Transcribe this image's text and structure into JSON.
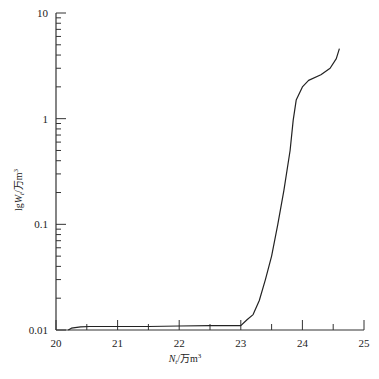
{
  "chart_data": {
    "type": "line",
    "title": "",
    "xlabel": "N_t/万m³",
    "ylabel": "lgW_t/万m³",
    "xlabel_parts": {
      "main": "N",
      "sub": "t",
      "rest": "/万m",
      "sup": "3"
    },
    "ylabel_parts": {
      "pre": "lg",
      "main": "W",
      "sub": "t",
      "rest": "/万m",
      "sup": "3"
    },
    "x_scale": "linear",
    "y_scale": "log",
    "xlim": [
      20,
      25
    ],
    "ylim": [
      0.01,
      10
    ],
    "x_ticks": [
      20,
      21,
      22,
      23,
      24,
      25
    ],
    "x_tick_labels": [
      "20",
      "21",
      "22",
      "23",
      "24",
      "25"
    ],
    "y_ticks": [
      0.01,
      0.1,
      1,
      10
    ],
    "y_tick_labels": [
      "0.01",
      "0.1",
      "1",
      "10"
    ],
    "grid": false,
    "legend": null,
    "series": [
      {
        "name": "W_t vs N_t",
        "color": "#222222",
        "x": [
          20.2,
          20.25,
          20.4,
          20.55,
          21.0,
          21.5,
          22.0,
          22.5,
          23.0,
          23.1,
          23.2,
          23.3,
          23.4,
          23.5,
          23.6,
          23.7,
          23.8,
          23.85,
          23.9,
          24.0,
          24.1,
          24.3,
          24.45,
          24.55,
          24.6
        ],
        "y": [
          0.01,
          0.0104,
          0.0107,
          0.0108,
          0.0108,
          0.0108,
          0.0109,
          0.011,
          0.011,
          0.0125,
          0.014,
          0.019,
          0.03,
          0.05,
          0.1,
          0.21,
          0.5,
          0.97,
          1.5,
          2.0,
          2.3,
          2.6,
          3.0,
          3.7,
          4.6
        ]
      }
    ]
  }
}
